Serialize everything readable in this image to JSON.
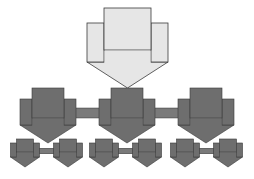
{
  "diagram": {
    "type": "hierarchy",
    "colors": {
      "root_fill": "#e6e6e6",
      "node_fill": "#6e6e6e",
      "stroke": "#3a3a3a",
      "connector_fill": "#7a7a7a"
    },
    "root": {
      "id": "root",
      "children": [
        {
          "id": "level2-a",
          "children": [
            {
              "id": "level3-a1"
            },
            {
              "id": "level3-a2"
            }
          ]
        },
        {
          "id": "level2-b",
          "children": [
            {
              "id": "level3-b1"
            },
            {
              "id": "level3-b2"
            }
          ]
        },
        {
          "id": "level2-c",
          "children": [
            {
              "id": "level3-c1"
            },
            {
              "id": "level3-c2"
            }
          ]
        }
      ]
    },
    "sibling_links": [
      [
        "level2-a",
        "level2-b"
      ],
      [
        "level2-b",
        "level2-c"
      ],
      [
        "level3-a1",
        "level3-a2"
      ],
      [
        "level3-b1",
        "level3-b2"
      ],
      [
        "level3-c1",
        "level3-c2"
      ]
    ]
  }
}
